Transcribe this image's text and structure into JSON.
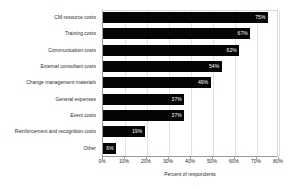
{
  "chart_data": {
    "type": "bar",
    "orientation": "horizontal",
    "title": "",
    "xlabel": "Percent of respondents",
    "ylabel": "",
    "xlim": [
      0,
      80
    ],
    "grid": true,
    "legend": "none",
    "xticks": [
      "0%",
      "10%",
      "20%",
      "30%",
      "40%",
      "50%",
      "60%",
      "70%",
      "80%"
    ],
    "xtick_values": [
      0,
      10,
      20,
      30,
      40,
      50,
      60,
      70,
      80
    ],
    "categories": [
      "CM resource costs",
      "Training costs",
      "Communication costs",
      "External consultant costs",
      "Change management materials",
      "General expenses",
      "Event costs",
      "Reinforcement and recognition costs",
      "Other"
    ],
    "values": [
      75,
      67,
      62,
      54,
      49,
      37,
      37,
      19,
      6
    ],
    "value_labels": [
      "75%",
      "67%",
      "62%",
      "54%",
      "49%",
      "37%",
      "37%",
      "19%",
      "6%"
    ],
    "bar_color": "#050505",
    "value_label_color": "#ffffff",
    "gridline_color": "#e2e2e2",
    "axis_color": "#9a9a9a"
  }
}
